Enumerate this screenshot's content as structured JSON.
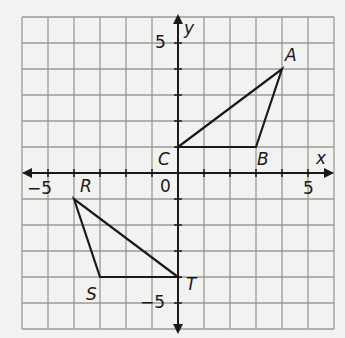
{
  "axes": {
    "x_label": "x",
    "y_label": "y",
    "x_range": [
      -6,
      6
    ],
    "y_range": [
      -6,
      6
    ],
    "tick_labels": {
      "x_neg": "−5",
      "x_pos": "5",
      "origin": "0",
      "y_pos": "5",
      "y_neg": "−5"
    }
  },
  "triangles": [
    {
      "name": "ABC",
      "vertices": [
        {
          "label": "A",
          "x": 4,
          "y": 4
        },
        {
          "label": "B",
          "x": 3,
          "y": 1
        },
        {
          "label": "C",
          "x": 0,
          "y": 1
        }
      ]
    },
    {
      "name": "RST",
      "vertices": [
        {
          "label": "R",
          "x": -4,
          "y": -1
        },
        {
          "label": "S",
          "x": -3,
          "y": -4
        },
        {
          "label": "T",
          "x": 0,
          "y": -4
        }
      ]
    }
  ]
}
